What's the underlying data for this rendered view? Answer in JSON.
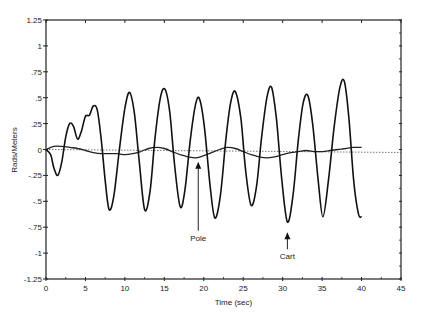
{
  "chart_data": {
    "type": "line",
    "title": "",
    "xlabel": "Time (sec)",
    "ylabel": "Rads/Meters",
    "xlim": [
      0,
      45
    ],
    "ylim": [
      -1.25,
      1.25
    ],
    "xticks": [
      0,
      5,
      10,
      15,
      20,
      25,
      30,
      35,
      40,
      45
    ],
    "xtick_labels": [
      "0",
      "5",
      "10",
      "15",
      "20",
      "25",
      "30",
      "35",
      "40",
      "45"
    ],
    "yticks": [
      1.25,
      1,
      0.75,
      0.5,
      0.25,
      0,
      -0.25,
      -0.5,
      -0.75,
      -1,
      -1.25
    ],
    "ytick_labels": [
      "1.25",
      "1",
      ".75",
      ".5",
      ".25",
      "0",
      "-.25",
      "-.5",
      "-.75",
      "-1",
      "-1.25"
    ],
    "grid": false,
    "zero_line": "dotted",
    "series": [
      {
        "name": "Cart",
        "x": [
          0,
          0.6,
          1.0,
          1.5,
          2.0,
          2.5,
          3.0,
          3.5,
          4.0,
          4.5,
          5.0,
          5.5,
          6.0,
          6.5,
          7.0,
          7.5,
          8.0,
          8.6,
          9.3,
          10.0,
          10.6,
          11.2,
          11.8,
          12.5,
          13.2,
          13.8,
          14.5,
          15.1,
          15.7,
          16.3,
          17.0,
          17.6,
          18.3,
          19.0,
          19.5,
          20.1,
          20.8,
          21.4,
          22.1,
          22.8,
          23.4,
          24.0,
          24.7,
          25.3,
          26.0,
          26.7,
          27.3,
          28.0,
          28.6,
          29.2,
          29.9,
          30.6,
          31.3,
          32.0,
          32.6,
          33.2,
          33.8,
          34.5,
          35.1,
          35.8,
          36.5,
          37.2,
          37.8,
          38.4,
          39.0,
          39.6,
          40.0
        ],
        "values": [
          0,
          -0.05,
          -0.18,
          -0.25,
          -0.12,
          0.12,
          0.25,
          0.22,
          0.1,
          0.18,
          0.32,
          0.33,
          0.42,
          0.38,
          0.1,
          -0.3,
          -0.58,
          -0.45,
          0.0,
          0.4,
          0.55,
          0.35,
          -0.1,
          -0.58,
          -0.4,
          0.1,
          0.5,
          0.58,
          0.35,
          -0.15,
          -0.55,
          -0.4,
          0.1,
          0.45,
          0.48,
          0.2,
          -0.35,
          -0.66,
          -0.45,
          0.1,
          0.45,
          0.56,
          0.3,
          -0.2,
          -0.54,
          -0.35,
          0.1,
          0.5,
          0.6,
          0.3,
          -0.3,
          -0.7,
          -0.45,
          0.1,
          0.45,
          0.52,
          0.25,
          -0.3,
          -0.65,
          -0.3,
          0.2,
          0.58,
          0.66,
          0.3,
          -0.3,
          -0.62,
          -0.65
        ]
      },
      {
        "name": "Pole",
        "x": [
          0,
          1,
          2,
          3,
          4,
          5,
          6,
          7,
          8,
          9,
          10,
          11,
          12,
          13,
          14,
          15,
          16,
          17,
          18,
          19,
          20,
          21,
          22,
          23,
          24,
          25,
          26,
          27,
          28,
          29,
          30,
          31,
          32,
          33,
          34,
          35,
          36,
          37,
          38,
          39,
          40
        ],
        "values": [
          0,
          0.03,
          0.03,
          0.02,
          0.01,
          -0.01,
          -0.03,
          -0.04,
          -0.04,
          -0.04,
          -0.05,
          -0.04,
          -0.02,
          0.01,
          0.02,
          0.01,
          -0.02,
          -0.05,
          -0.07,
          -0.08,
          -0.06,
          -0.03,
          0.0,
          0.02,
          0.01,
          -0.02,
          -0.05,
          -0.07,
          -0.08,
          -0.07,
          -0.05,
          -0.03,
          -0.02,
          -0.01,
          -0.02,
          -0.02,
          -0.01,
          0.0,
          0.01,
          0.02,
          0.02
        ]
      }
    ],
    "annotations": [
      {
        "text": "Pole",
        "arrow_to_x": 19.3,
        "arrow_to_y": -0.08,
        "label_x": 19.3,
        "label_y": -0.88
      },
      {
        "text": "Cart",
        "arrow_to_x": 30.6,
        "arrow_to_y": -0.76,
        "label_x": 30.6,
        "label_y": -1.06
      }
    ]
  },
  "labels": {
    "xlabel": "Time (sec)",
    "ylabel": "Rads/Meters",
    "pole": "Pole",
    "cart": "Cart"
  }
}
